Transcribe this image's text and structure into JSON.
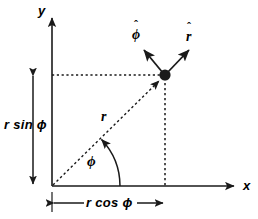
{
  "figure": {
    "background_color": "#ffffff",
    "stroke_color": "#1a1a1a",
    "width": 258,
    "height": 219
  },
  "axes": {
    "y_label": "y",
    "x_label": "x",
    "origin": {
      "x": 52,
      "y": 186
    },
    "x_axis_end": {
      "x": 238,
      "y": 186
    },
    "y_axis_end": {
      "x": 52,
      "y": 14
    }
  },
  "point": {
    "label": "",
    "x": 165,
    "y": 75,
    "radius": 5.5
  },
  "unit_vectors": [
    {
      "name": "phi-hat",
      "label": "ϕ",
      "hat": "ˆ",
      "from": {
        "x": 165,
        "y": 75
      },
      "to": {
        "x": 142,
        "y": 47
      }
    },
    {
      "name": "r-hat",
      "label": "r",
      "hat": "ˆ",
      "from": {
        "x": 165,
        "y": 75
      },
      "to": {
        "x": 192,
        "y": 47
      }
    }
  ],
  "radial_line": {
    "label": "r",
    "from": {
      "x": 52,
      "y": 186
    },
    "to": {
      "x": 165,
      "y": 75
    },
    "style": "dashed-with-arrow"
  },
  "angle_arc": {
    "label": "ϕ",
    "center": {
      "x": 52,
      "y": 186
    },
    "radius": 68,
    "start_deg": 0,
    "end_deg": 44.5,
    "direction": "counterclockwise"
  },
  "measurements": [
    {
      "name": "r-sin-phi",
      "label": "r sin ϕ",
      "orientation": "vertical",
      "from": {
        "x": 33,
        "y": 75
      },
      "to": {
        "x": 33,
        "y": 186
      },
      "arrowheads": "both"
    },
    {
      "name": "r-cos-phi",
      "label": "r cos ϕ",
      "orientation": "horizontal",
      "from": {
        "x": 52,
        "y": 203
      },
      "to": {
        "x": 165,
        "y": 203
      },
      "arrowheads": "both"
    }
  ],
  "guide_lines": [
    {
      "name": "horizontal-projection",
      "from": {
        "x": 52,
        "y": 75
      },
      "to": {
        "x": 165,
        "y": 75
      },
      "style": "dotted"
    },
    {
      "name": "vertical-projection",
      "from": {
        "x": 165,
        "y": 75
      },
      "to": {
        "x": 165,
        "y": 186
      },
      "style": "dashed"
    }
  ]
}
